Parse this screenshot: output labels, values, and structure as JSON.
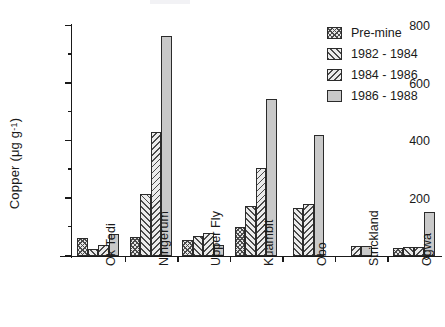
{
  "axes": {
    "ylabel_text": "Copper  (μg g",
    "ylabel_sup": "-1",
    "ylabel_close": ")",
    "ytick_labels": [
      "0",
      "200",
      "400",
      "600",
      "800"
    ]
  },
  "legend": {
    "items": [
      {
        "label": "Pre-mine",
        "pattern": "cross-hatch"
      },
      {
        "label": "1982 - 1984",
        "pattern": "forward-diagonal-hatch"
      },
      {
        "label": "1984 - 1986",
        "pattern": "backward-diagonal-hatch"
      },
      {
        "label": "1986 - 1988",
        "pattern": "solid-grey"
      }
    ]
  },
  "chart_data": {
    "type": "bar",
    "title": "",
    "xlabel": "",
    "ylabel": "Copper (μg g-1)",
    "ylim": [
      0,
      800
    ],
    "ytick_major_step": 200,
    "ytick_minor_step": 100,
    "grid": false,
    "legend_position": "top-right",
    "categories": [
      "Ok Tedi",
      "Ningerum",
      "Upper Fly",
      "Kuambit",
      "Obo",
      "Strickland",
      "Ogwa"
    ],
    "series": [
      {
        "name": "Pre-mine",
        "values": [
          62,
          65,
          55,
          100,
          null,
          null,
          28
        ]
      },
      {
        "name": "1982 - 1984",
        "values": [
          25,
          215,
          70,
          175,
          168,
          null,
          30
        ]
      },
      {
        "name": "1984 - 1986",
        "values": [
          38,
          430,
          80,
          305,
          180,
          35,
          30
        ]
      },
      {
        "name": "1986 - 1988",
        "values": [
          75,
          765,
          38,
          545,
          420,
          35,
          153
        ]
      }
    ]
  }
}
